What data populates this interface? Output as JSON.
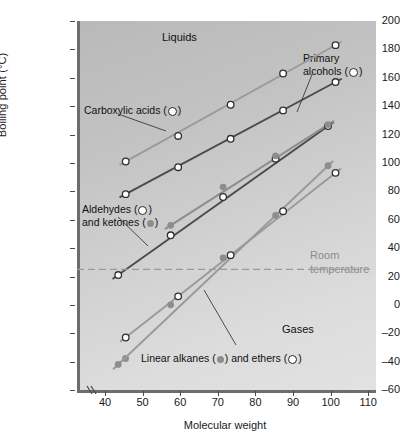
{
  "chart_data": {
    "type": "scatter",
    "title": "",
    "xlabel": "Molecular weight",
    "ylabel": "Boiling point (°C)",
    "xlim": [
      33,
      112
    ],
    "ylim": [
      -60,
      200
    ],
    "xticks": [
      40,
      50,
      60,
      70,
      80,
      90,
      100,
      110
    ],
    "yticks": [
      -60,
      -40,
      -20,
      0,
      20,
      40,
      60,
      80,
      100,
      120,
      140,
      160,
      180,
      200
    ],
    "grid": false,
    "axis_break_x": true,
    "legend_position": "inline-annotations",
    "series": [
      {
        "name": "Carboxylic acids",
        "marker": "open-circle",
        "line_color": "#9a9a9a",
        "points": [
          {
            "x": 46,
            "y": 101
          },
          {
            "x": 60,
            "y": 119
          },
          {
            "x": 74,
            "y": 141
          },
          {
            "x": 88,
            "y": 163
          },
          {
            "x": 102,
            "y": 183
          }
        ]
      },
      {
        "name": "Primary alcohols",
        "marker": "open-circle",
        "line_color": "#4a4a4a",
        "points": [
          {
            "x": 46,
            "y": 78
          },
          {
            "x": 60,
            "y": 97
          },
          {
            "x": 74,
            "y": 117
          },
          {
            "x": 88,
            "y": 137
          },
          {
            "x": 102,
            "y": 157
          }
        ]
      },
      {
        "name": "Aldehydes",
        "marker": "open-circle",
        "line_color": "#4a4a4a",
        "points": [
          {
            "x": 44,
            "y": 21
          },
          {
            "x": 58,
            "y": 49
          },
          {
            "x": 72,
            "y": 76
          },
          {
            "x": 86,
            "y": 103
          },
          {
            "x": 100,
            "y": 126
          }
        ]
      },
      {
        "name": "Ketones",
        "marker": "filled-circle",
        "line_color": "#8d8d8d",
        "points": [
          {
            "x": 58,
            "y": 56
          },
          {
            "x": 72,
            "y": 83
          },
          {
            "x": 86,
            "y": 105
          },
          {
            "x": 100,
            "y": 127
          }
        ]
      },
      {
        "name": "Ethers",
        "marker": "open-circle",
        "line_color": "#9a9a9a",
        "points": [
          {
            "x": 46,
            "y": -23
          },
          {
            "x": 60,
            "y": 6
          },
          {
            "x": 74,
            "y": 35
          },
          {
            "x": 88,
            "y": 66
          },
          {
            "x": 102,
            "y": 93
          }
        ]
      },
      {
        "name": "Linear alkanes",
        "marker": "filled-circle",
        "line_color": "#9a9a9a",
        "points": [
          {
            "x": 44,
            "y": -42
          },
          {
            "x": 58,
            "y": 0
          },
          {
            "x": 72,
            "y": 33
          },
          {
            "x": 86,
            "y": 63
          },
          {
            "x": 100,
            "y": 98
          }
        ]
      }
    ],
    "reference_lines": [
      {
        "name": "Room temperature",
        "axis": "y",
        "value": 25,
        "style": "dashed",
        "color": "#9a9a9a"
      }
    ],
    "annotations": [
      {
        "name": "Liquids",
        "text": "Liquids",
        "x": 162,
        "y": 31
      },
      {
        "name": "Gases",
        "text": "Gases",
        "x": 282,
        "y": 323
      }
    ]
  },
  "axes": {
    "y_title": "Boiling point (°C)",
    "x_title": "Molecular weight",
    "y_tick_labels": [
      "200",
      "180",
      "160",
      "140",
      "120",
      "100",
      "80",
      "60",
      "40",
      "20",
      "0",
      "–20",
      "–40",
      "–60"
    ],
    "x_tick_labels": [
      "40",
      "50",
      "60",
      "70",
      "80",
      "90",
      "100",
      "110"
    ]
  },
  "region_labels": {
    "liquids": "Liquids",
    "gases": "Gases"
  },
  "reference": {
    "room_temperature_line1": "Room",
    "room_temperature_line2": "temperature"
  },
  "series_labels": {
    "carboxylic_acids_pre": "Carboxylic acids (",
    "carboxylic_acids_post": ")",
    "primary_alcohols_line1": "Primary",
    "primary_alcohols_line2_pre": "alcohols (",
    "primary_alcohols_line2_post": ")",
    "aldehydes_line1_pre": "Aldehydes (",
    "aldehydes_line1_post": ")",
    "aldehydes_line2_pre": "and ketones (",
    "aldehydes_line2_post": ")",
    "alkanes_pre": "Linear alkanes (",
    "alkanes_mid": ") and ethers (",
    "alkanes_post": ")"
  },
  "colors": {
    "plot_background_light": "#e2e2e2",
    "plot_background_dark": "#b9b9b9",
    "axis": "#6d6d6d",
    "line_dark": "#4a4a4a",
    "line_light": "#9a9a9a",
    "marker_open_fill": "#ffffff",
    "marker_filled": "#8d8d8d",
    "reference_line": "#9a9a9a",
    "text": "#111111",
    "reference_text": "#8c8c8c"
  }
}
